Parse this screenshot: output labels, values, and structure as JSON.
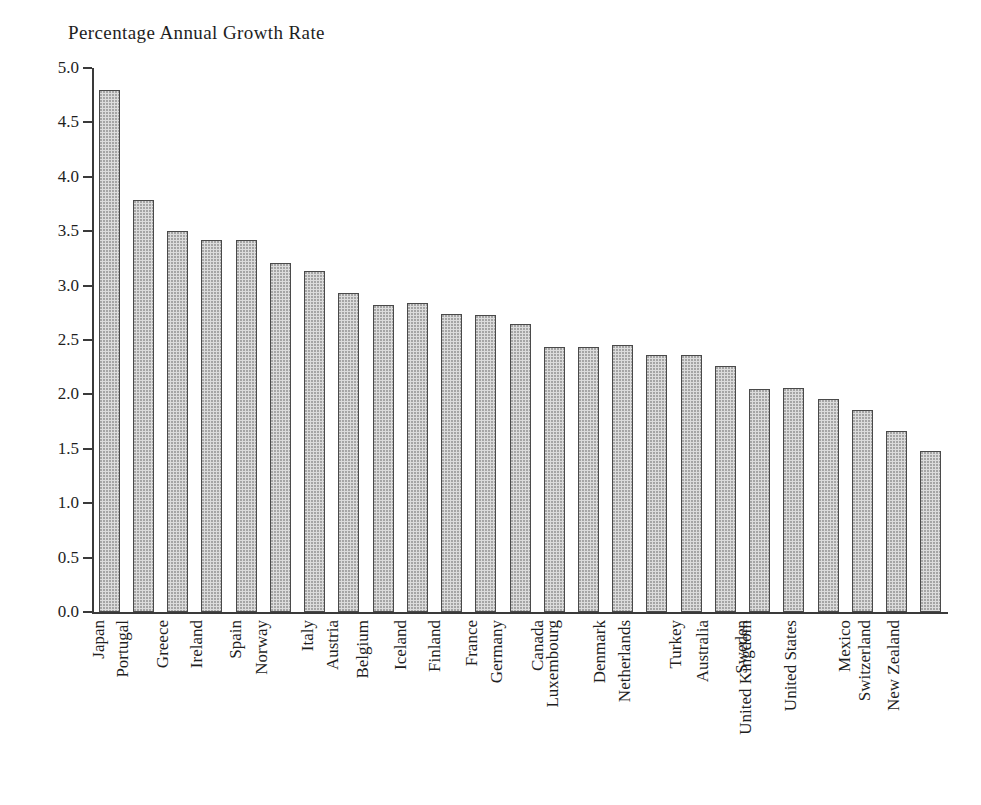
{
  "chart_data": {
    "type": "bar",
    "title": "Percentage Annual Growth Rate",
    "xlabel": "",
    "ylabel": "",
    "ylim": [
      0.0,
      5.0
    ],
    "yticks": [
      "0.0",
      "0.5",
      "1.0",
      "1.5",
      "2.0",
      "2.5",
      "3.0",
      "3.5",
      "4.0",
      "4.5",
      "5.0"
    ],
    "ytick_values": [
      0.0,
      0.5,
      1.0,
      1.5,
      2.0,
      2.5,
      3.0,
      3.5,
      4.0,
      4.5,
      5.0
    ],
    "grid": false,
    "legend": null,
    "bar_fill": "#dcdcdc",
    "bar_edge": "#4a4a4a",
    "axis_color": "#3a3a3a",
    "categories": [
      "Japan",
      "Portugal",
      "Greece",
      "Ireland",
      "Spain",
      "Norway",
      "Italy",
      "Austria",
      "Belgium",
      "Iceland",
      "Finland",
      "France",
      "Germany",
      "Canada",
      "Luxembourg",
      "Denmark",
      "Netherlands",
      "Turkey",
      "Australia",
      "Sweden",
      "United Kingdom",
      "United States",
      "Mexico",
      "Switzerland",
      "New Zealand"
    ],
    "values": [
      4.8,
      3.79,
      3.5,
      3.42,
      3.42,
      3.21,
      3.13,
      2.93,
      2.82,
      2.84,
      2.74,
      2.73,
      2.65,
      2.44,
      2.44,
      2.45,
      2.36,
      2.36,
      2.26,
      2.05,
      2.06,
      1.96,
      1.86,
      1.66,
      1.48
    ]
  }
}
